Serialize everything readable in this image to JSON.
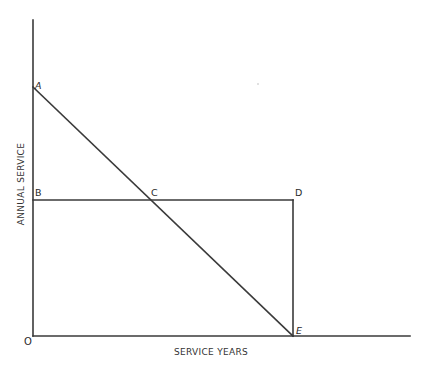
{
  "diagram": {
    "type": "geometric-line-diagram",
    "axes": {
      "x_label": "SERVICE YEARS",
      "y_label": "ANNUAL SERVICE",
      "origin_label": "O"
    },
    "points": {
      "A": {
        "label": "A",
        "x": 33,
        "y": 87
      },
      "B": {
        "label": "B",
        "x": 33,
        "y": 200
      },
      "C": {
        "label": "C",
        "x": 150,
        "y": 200
      },
      "D": {
        "label": "D",
        "x": 293,
        "y": 200
      },
      "E": {
        "label": "E",
        "x": 293,
        "y": 336
      }
    },
    "segments": [
      {
        "from": "A",
        "to": "E",
        "description": "diagonal line A to E through C"
      },
      {
        "from": "B",
        "to": "D",
        "description": "horizontal line B to D through C"
      },
      {
        "from": "D",
        "to": "E",
        "description": "vertical line D to E"
      }
    ],
    "colors": {
      "line": "#3a3a3a",
      "text": "#2a2a2a",
      "background": "#ffffff"
    }
  }
}
